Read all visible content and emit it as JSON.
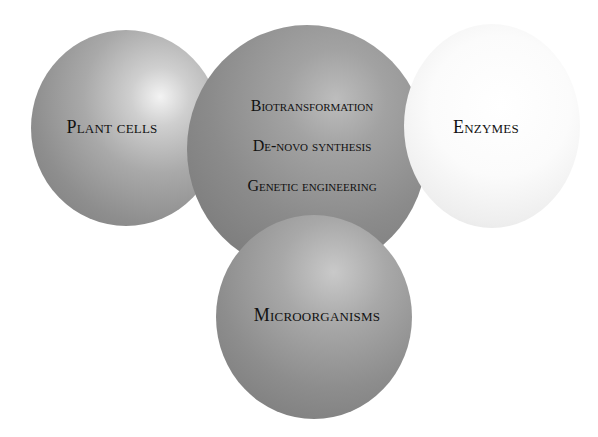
{
  "diagram": {
    "type": "overlapping-spheres",
    "spheres": [
      {
        "id": "plant-cells",
        "label": "Plant cells",
        "tone": "#9a9a9a"
      },
      {
        "id": "center",
        "items": [
          "Biotransformation",
          "De-novo synthesis",
          "Genetic engineering"
        ],
        "tone": "#8b8b8b"
      },
      {
        "id": "enzymes",
        "label": "Enzymes",
        "tone": "#f4f4f4"
      },
      {
        "id": "microorganisms",
        "label": "Microorganisms",
        "tone": "#959595"
      }
    ]
  }
}
